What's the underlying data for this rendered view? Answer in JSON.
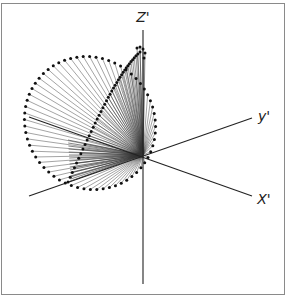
{
  "figure": {
    "type": "3d-vector-cone-diagram",
    "colors": {
      "frame": "#8a8a8a",
      "axis": "#222222",
      "spoke": "#333333",
      "dot": "#111111"
    },
    "origin": [
      143,
      155
    ],
    "axes": [
      {
        "id": "z",
        "label": "Z'",
        "from": [
          143,
          30
        ],
        "to": [
          143,
          284
        ],
        "label_pos": [
          143,
          22
        ]
      },
      {
        "id": "y",
        "label": "y'",
        "from": [
          29,
          196
        ],
        "to": [
          252,
          118
        ],
        "label_pos": [
          263,
          121
        ]
      },
      {
        "id": "x",
        "label": "X'",
        "from": [
          29,
          117
        ],
        "to": [
          252,
          196
        ],
        "label_pos": [
          263,
          204
        ]
      }
    ],
    "outer_ring": {
      "cx": 90,
      "cy": 123,
      "rx": 64,
      "ry": 68,
      "rotation": -38,
      "points": 64
    },
    "inner_curve": {
      "description": "trace of vector tips looping from near z-axis top down to lower-left",
      "points": 40
    }
  }
}
